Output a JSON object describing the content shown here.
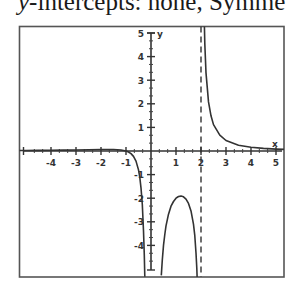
{
  "caption": {
    "var": "y",
    "rest": "-intercepts:  none, Symme"
  },
  "chart_data": {
    "type": "line",
    "title": "",
    "xlabel": "x",
    "ylabel": "y",
    "function_shape": "rational function with vertical asymptotes at x=0 and x=2, x-intercept at x=-1, horizontal asymptote y=0",
    "xlim": [
      -5.28,
      5.32
    ],
    "ylim": [
      -5.34,
      5.3
    ],
    "grid": false,
    "legend": null,
    "x_ticks": [
      -4,
      -3,
      -2,
      -1,
      1,
      2,
      3,
      4,
      5
    ],
    "x_tick_labels": [
      "-4",
      "-3",
      "-2",
      "-1",
      "1",
      "2",
      "3",
      "4",
      "5"
    ],
    "y_ticks": [
      5,
      4,
      3,
      2,
      1,
      -1,
      -2,
      -3,
      -4
    ],
    "y_tick_labels": [
      "5",
      "4",
      "3",
      "2",
      "1",
      "-1",
      "-2",
      "-3",
      "-4"
    ],
    "minor_ticks_per_unit": 3,
    "vertical_asymptotes": [
      {
        "x": 2,
        "style": "dashed"
      }
    ],
    "series": [
      {
        "name": "left branch",
        "x": [
          -5.28,
          -5,
          -4.5,
          -4,
          -3.5,
          -3,
          -2.5,
          -2,
          -1.5,
          -1.2,
          -1,
          -0.9,
          -0.8,
          -0.7,
          -0.6,
          -0.5,
          -0.45,
          -0.4,
          -0.35,
          -0.3,
          -0.27,
          -0.25
        ],
        "y": [
          0.02,
          0.023,
          0.027,
          0.031,
          0.037,
          0.044,
          0.053,
          0.063,
          0.063,
          0.043,
          0,
          -0.043,
          -0.112,
          -0.227,
          -0.427,
          -0.8,
          -1.114,
          -1.563,
          -2.258,
          -3.382,
          -4.41,
          -5.33
        ]
      },
      {
        "name": "middle branch",
        "x": [
          0.41,
          0.45,
          0.5,
          0.55,
          0.6,
          0.7,
          0.8,
          0.9,
          1.0,
          1.1,
          1.2,
          1.3,
          1.4,
          1.5,
          1.6,
          1.7,
          1.75,
          1.8,
          1.83,
          1.85
        ],
        "y": [
          -5.27,
          -4.62,
          -4.0,
          -3.54,
          -3.17,
          -2.68,
          -2.34,
          -2.14,
          -2.0,
          -1.93,
          -1.91,
          -1.94,
          -2.04,
          -2.22,
          -2.54,
          -3.11,
          -3.59,
          -4.32,
          -4.97,
          -5.55
        ]
      },
      {
        "name": "right branch",
        "x": [
          2.06,
          2.08,
          2.1,
          2.15,
          2.2,
          2.3,
          2.4,
          2.5,
          2.75,
          3.0,
          3.5,
          4.0,
          4.5,
          5.0,
          5.32
        ],
        "y": [
          11.9,
          8.9,
          7.03,
          4.55,
          3.31,
          2.08,
          1.49,
          1.12,
          0.67,
          0.444,
          0.245,
          0.156,
          0.109,
          0.08,
          0.068
        ]
      }
    ]
  }
}
